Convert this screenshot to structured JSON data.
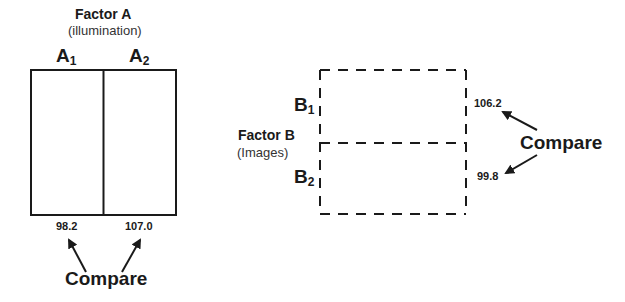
{
  "factor_a": {
    "title": "Factor A",
    "subtitle": "(illumination)",
    "levels": [
      {
        "base": "A",
        "sub": "1"
      },
      {
        "base": "A",
        "sub": "2"
      }
    ],
    "means": [
      "98.2",
      "107.0"
    ],
    "compare_label": "Compare"
  },
  "factor_b": {
    "title": "Factor B",
    "subtitle": "(Images)",
    "levels": [
      {
        "base": "B",
        "sub": "1"
      },
      {
        "base": "B",
        "sub": "2"
      }
    ],
    "means": [
      "106.2",
      "99.8"
    ],
    "compare_label": "Compare"
  },
  "colors": {
    "line": "#1a1a1a",
    "background": "#ffffff"
  }
}
